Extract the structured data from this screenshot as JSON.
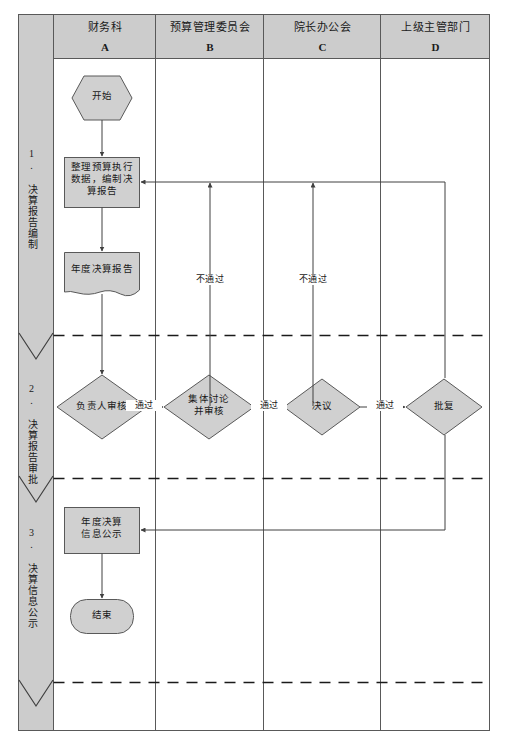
{
  "diagram": {
    "title_columns": [
      {
        "name": "财务科",
        "code": "A"
      },
      {
        "name": "预算管理委员会",
        "code": "B"
      },
      {
        "name": "院长办公会",
        "code": "C"
      },
      {
        "name": "上级主管部门",
        "code": "D"
      }
    ],
    "phases": [
      {
        "index": "1.",
        "label": "1. 决算报告编制"
      },
      {
        "index": "2.",
        "label": "2. 决算报告审批"
      },
      {
        "index": "3.",
        "label": "3. 决算信息公示"
      }
    ],
    "nodes": {
      "start": "开始",
      "prepare": "整理预算执行\n数据，编制决\n算报告",
      "report_doc": "年度决算报告",
      "leader_review": "负责人审核",
      "committee_review": "集体讨论\n并审核",
      "resolution": "决议",
      "approval_reply": "批复",
      "publish": "年度决算\n信息公示",
      "end": "结束"
    },
    "edge_labels": {
      "pass_1": "通过",
      "pass_2": "通过",
      "pass_3": "通过",
      "fail_1": "不通过",
      "fail_2": "不通过"
    },
    "colors": {
      "node_fill": "#d0d0d0",
      "node_stroke": "#595959",
      "band_fill": "#cccccc",
      "frame_stroke": "#595959",
      "line_stroke": "#595959",
      "dashed_stroke": "#1a1a1a",
      "text": "#1a1a1a",
      "background": "#ffffff"
    }
  }
}
